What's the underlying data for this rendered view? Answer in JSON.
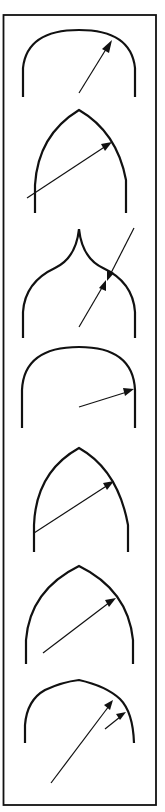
{
  "figure": {
    "title": "",
    "ink_color": "#111111",
    "background_color": "#ffffff",
    "panel_count": 7,
    "panels": [
      {
        "id": 1,
        "arch_type": "segmental-round",
        "arrows": 1
      },
      {
        "id": 2,
        "arch_type": "equilateral-pointed",
        "arrows": 1
      },
      {
        "id": 3,
        "arch_type": "ogee",
        "arrows": 2
      },
      {
        "id": 4,
        "arch_type": "semicircular-round",
        "arrows": 1
      },
      {
        "id": 5,
        "arch_type": "lancet-pointed",
        "arrows": 1
      },
      {
        "id": 6,
        "arch_type": "drop-pointed",
        "arrows": 1
      },
      {
        "id": 7,
        "arch_type": "four-centered",
        "arrows": 2
      }
    ]
  }
}
